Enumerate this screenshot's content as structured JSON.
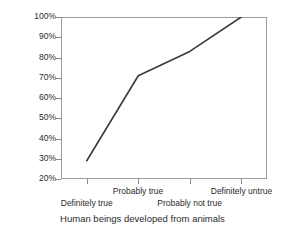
{
  "chart_data": {
    "type": "line",
    "title": "",
    "xlabel": "Human beings developed from animals",
    "ylabel": "Cumulative Percent",
    "categories": [
      "Definitely true",
      "Probably true",
      "Probably not true",
      "Definitely untrue"
    ],
    "values": [
      29,
      71,
      83,
      100
    ],
    "ylim": [
      20,
      100
    ],
    "y_ticks": [
      "20%",
      "30%",
      "40%",
      "50%",
      "60%",
      "70%",
      "80%",
      "90%",
      "100%"
    ],
    "y_tick_values": [
      20,
      30,
      40,
      50,
      60,
      70,
      80,
      90,
      100
    ],
    "grid": false,
    "legend": "none",
    "line_color": "#3a3a3a",
    "frame_color": "#9a9a9a",
    "text_color": "#2b2b2b"
  },
  "axes": {
    "y_title": "Cumulative Percent",
    "x_title": "Human beings developed from animals"
  },
  "x_labels": [
    {
      "text": "Definitely true",
      "row": "bot"
    },
    {
      "text": "Probably true",
      "row": "top"
    },
    {
      "text": "Probably not true",
      "row": "bot"
    },
    {
      "text": "Definitely untrue",
      "row": "top"
    }
  ]
}
